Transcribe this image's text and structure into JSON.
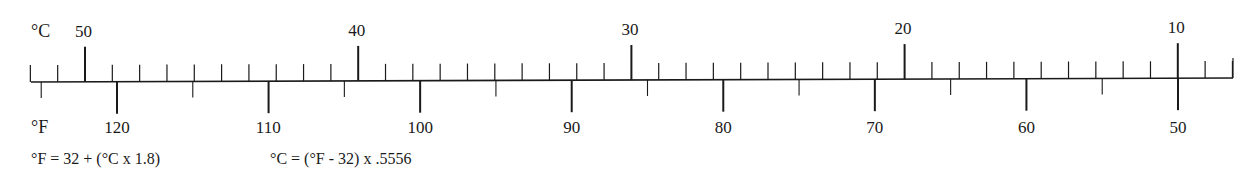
{
  "diagram": {
    "celsius_unit_label": "°C",
    "fahrenheit_unit_label": "°F",
    "celsius": {
      "major_labels": [
        "50",
        "40",
        "30",
        "20",
        "10"
      ],
      "major_values": [
        50,
        40,
        30,
        20,
        10
      ],
      "minor_step": 1,
      "range": [
        52,
        8
      ]
    },
    "fahrenheit": {
      "major_labels": [
        "120",
        "110",
        "100",
        "90",
        "80",
        "70",
        "60",
        "50"
      ],
      "major_values": [
        120,
        110,
        100,
        90,
        80,
        70,
        60,
        50
      ],
      "mid_step": 5
    },
    "formulas": {
      "c_to_f": "°F = 32 + (°C x 1.8)",
      "f_to_c": "°C = (°F - 32) x .5556"
    },
    "colors": {
      "ink": "#1a1a1a",
      "background": "#ffffff"
    }
  }
}
